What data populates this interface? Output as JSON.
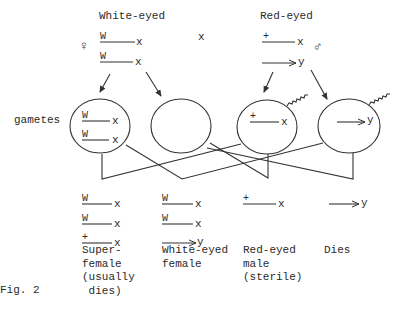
{
  "parents": {
    "female": {
      "label": "White-eyed",
      "symbol": "♀",
      "chromosomes": [
        {
          "allele": "W",
          "type": "x"
        },
        {
          "allele": "W",
          "type": "x"
        }
      ]
    },
    "cross_symbol": "x",
    "male": {
      "label": "Red-eyed",
      "symbol": "♂",
      "chromosomes": [
        {
          "allele": "+",
          "type": "x"
        },
        {
          "allele": "",
          "type": "y"
        }
      ]
    }
  },
  "gametes_label": "gametes",
  "gametes": [
    {
      "name": "egg-WW",
      "chromosomes": [
        {
          "allele": "W",
          "type": "x"
        },
        {
          "allele": "W",
          "type": "x"
        }
      ]
    },
    {
      "name": "egg-empty",
      "chromosomes": []
    },
    {
      "name": "sperm-X",
      "chromosomes": [
        {
          "allele": "+",
          "type": "x"
        }
      ]
    },
    {
      "name": "sperm-Y",
      "chromosomes": [
        {
          "allele": "",
          "type": "y"
        }
      ]
    }
  ],
  "offspring": [
    {
      "chromosomes": [
        {
          "allele": "W",
          "type": "x"
        },
        {
          "allele": "W",
          "type": "x"
        },
        {
          "allele": "+",
          "type": "x"
        }
      ],
      "label_lines": [
        "Super-",
        "female",
        "(usually",
        " dies)"
      ]
    },
    {
      "chromosomes": [
        {
          "allele": "W",
          "type": "x"
        },
        {
          "allele": "W",
          "type": "x"
        },
        {
          "allele": "",
          "type": "y"
        }
      ],
      "label_lines": [
        "White-eyed",
        "female"
      ]
    },
    {
      "chromosomes": [
        {
          "allele": "+",
          "type": "x"
        }
      ],
      "label_lines": [
        "Red-eyed",
        "male",
        "(sterile)"
      ]
    },
    {
      "chromosomes": [
        {
          "allele": "",
          "type": "y"
        }
      ],
      "label_lines": [
        "Dies"
      ]
    }
  ],
  "figure_label": "Fig. 2"
}
